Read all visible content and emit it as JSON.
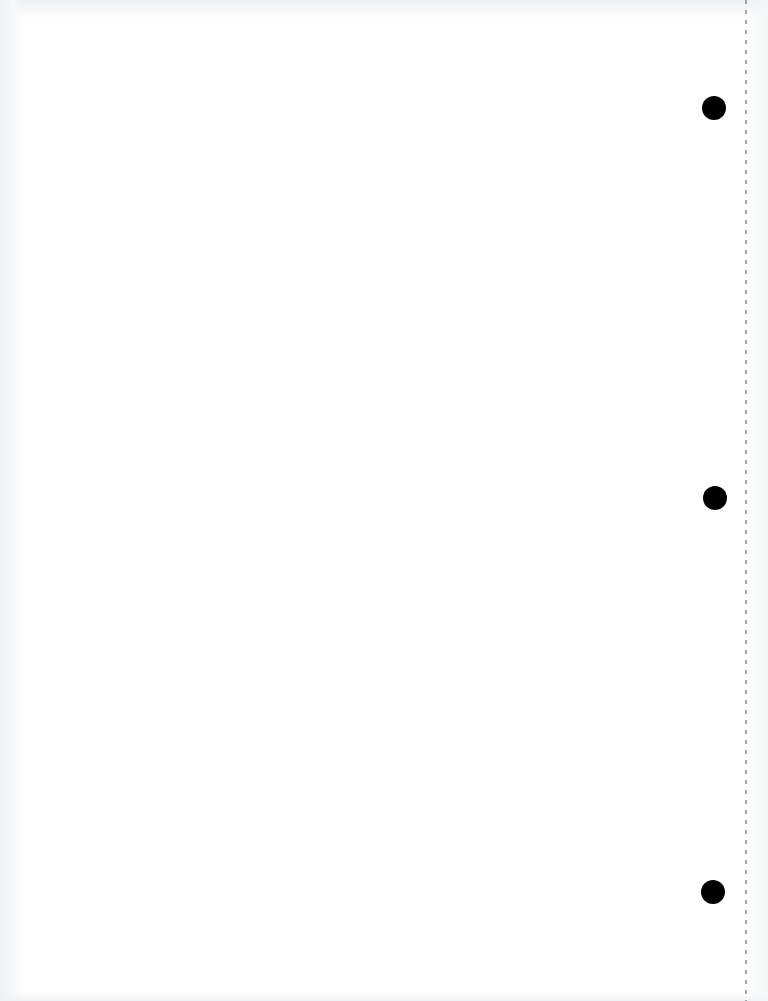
{
  "page": {
    "background": "#fefefe",
    "type": "blank-three-hole-punched-sheet"
  },
  "perforation": {
    "x": 745,
    "color": "#8a8a8a"
  },
  "punch_holes": [
    {
      "cx": 714,
      "cy": 108,
      "diameter": 24
    },
    {
      "cx": 715,
      "cy": 498,
      "diameter": 24
    },
    {
      "cx": 713,
      "cy": 892,
      "diameter": 24
    }
  ],
  "colors": {
    "hole": "#000000",
    "scan_shadow": "#eef0f1"
  }
}
